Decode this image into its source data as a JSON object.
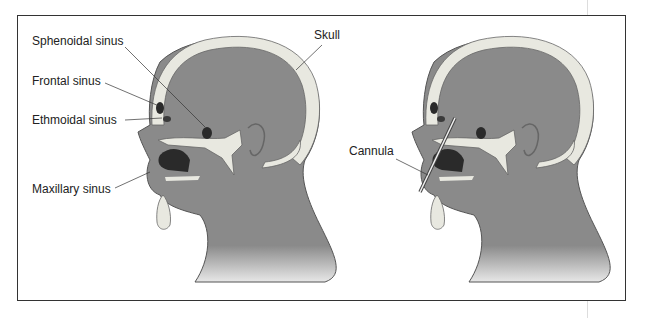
{
  "figure": {
    "left_panel": {
      "labels": {
        "sphenoidal": "Sphenoidal sinus",
        "frontal": "Frontal sinus",
        "ethmoidal": "Ethmoidal sinus",
        "maxillary": "Maxillary sinus",
        "skull": "Skull"
      }
    },
    "right_panel": {
      "labels": {
        "cannula": "Cannula"
      }
    },
    "colors": {
      "skin": "#8a8a8a",
      "bone": "#e8e8e0",
      "cavity": "#2a2a2a",
      "outline": "#333333"
    }
  }
}
